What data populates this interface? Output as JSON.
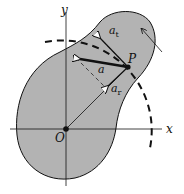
{
  "diagram": {
    "axes": {
      "x_label": "x",
      "y_label": "y",
      "origin_label": "O"
    },
    "point_label": "P",
    "vectors": {
      "a": "a",
      "a_t": {
        "base": "a",
        "sub": "t"
      },
      "a_r": {
        "base": "a",
        "sub": "r"
      }
    },
    "colors": {
      "body_fill": "#b3b3b3",
      "line": "#111111",
      "background": "#ffffff"
    }
  }
}
